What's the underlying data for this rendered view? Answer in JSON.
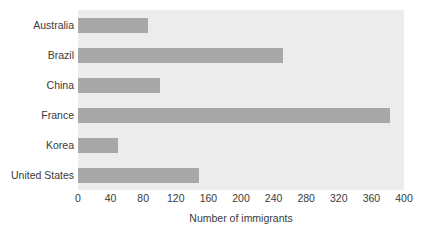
{
  "chart_data": {
    "type": "bar",
    "orientation": "horizontal",
    "title": "",
    "xlabel": "Number of immigrants",
    "ylabel": "",
    "categories": [
      "Australia",
      "Brazil",
      "China",
      "France",
      "Korea",
      "United States"
    ],
    "values": [
      86,
      252,
      101,
      383,
      49,
      149
    ],
    "xlim": [
      0,
      400
    ],
    "xticks": [
      0,
      40,
      80,
      120,
      160,
      200,
      240,
      280,
      320,
      360,
      400
    ],
    "xtick_labels": [
      "0",
      "40",
      "80",
      "120",
      "160",
      "200",
      "240",
      "280",
      "320",
      "360",
      "400"
    ],
    "grid": false,
    "legend": null,
    "bar_color": "#a8a8a8",
    "plot_background": "#ececec",
    "figure_background": "#ffffff",
    "text_color": "#3a3a3a"
  }
}
